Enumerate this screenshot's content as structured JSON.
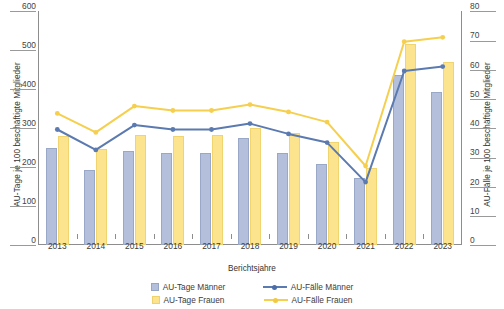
{
  "chart_data": {
    "type": "bar",
    "title": "",
    "xlabel": "Berichtsjahre",
    "ylabel": "AU-Tage je 100 beschäftigte Mitglieder",
    "ylabel_right": "AU-Fälle je 100 beschäftigte Mitglieder",
    "categories": [
      "2013",
      "2014",
      "2015",
      "2016",
      "2017",
      "2018",
      "2019",
      "2020",
      "2021",
      "2022",
      "2023"
    ],
    "ylim": [
      0,
      600
    ],
    "ylim_right": [
      0,
      80
    ],
    "yticks": [
      0,
      100,
      200,
      300,
      400,
      500,
      600
    ],
    "yticks_right": [
      0,
      10,
      20,
      30,
      40,
      50,
      60,
      70,
      80
    ],
    "grid": false,
    "legend_position": "bottom",
    "series": [
      {
        "name": "AU-Tage Männer",
        "type": "bar",
        "axis": "left",
        "color": "#b4c0db",
        "values": [
          249,
          192,
          240,
          235,
          237,
          275,
          235,
          208,
          172,
          436,
          392
        ]
      },
      {
        "name": "AU-Tage Frauen",
        "type": "bar",
        "axis": "left",
        "color": "#fce48f",
        "values": [
          280,
          245,
          283,
          280,
          281,
          300,
          288,
          264,
          197,
          515,
          470
        ]
      },
      {
        "name": "AU-Fälle Männer",
        "type": "line",
        "axis": "right",
        "color": "#5b7ab0",
        "values": [
          39.5,
          32.5,
          41.0,
          39.5,
          39.5,
          41.5,
          38.0,
          35.0,
          21.5,
          59.5,
          61.0
        ]
      },
      {
        "name": "AU-Fälle Frauen",
        "type": "line",
        "axis": "right",
        "color": "#f5cf4d",
        "values": [
          45.0,
          38.5,
          47.5,
          46.0,
          46.0,
          48.0,
          45.5,
          42.0,
          27.0,
          69.5,
          71.0
        ]
      }
    ]
  },
  "legend": {
    "items": [
      {
        "label": "AU-Tage Männer",
        "marker": "square-swatch-blue"
      },
      {
        "label": "AU-Fälle Männer",
        "marker": "line-marker-blue"
      },
      {
        "label": "AU-Tage Frauen",
        "marker": "square-swatch-yellow"
      },
      {
        "label": "AU-Fälle Frauen",
        "marker": "line-marker-yellow"
      }
    ]
  },
  "colors": {
    "bar_men": "#b4c0db",
    "bar_women": "#fce48f",
    "line_men": "#5b7ab0",
    "line_women": "#f5cf4d",
    "axis": "#8d8d8d",
    "text": "#3c3c3c"
  }
}
